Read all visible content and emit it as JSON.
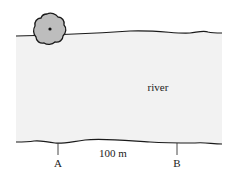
{
  "diagram": {
    "river_label": "river",
    "distance_label": "100 m",
    "point_a_label": "A",
    "point_b_label": "B",
    "colors": {
      "river_fill": "#f2f2f2",
      "bank_line": "#1a1a1a",
      "tree_fill": "#bdbdbd",
      "tree_outline": "#1a1a1a"
    }
  }
}
